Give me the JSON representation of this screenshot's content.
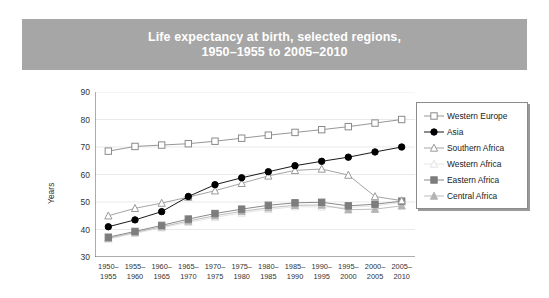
{
  "title": {
    "line1": "Life expectancy at birth, selected regions,",
    "line2": "1950–1955 to 2005–2010"
  },
  "axes": {
    "ylabel": "Years",
    "yticks": [
      "90",
      "80",
      "70",
      "60",
      "50",
      "40",
      "30"
    ]
  },
  "xticklabels_top": [
    "1950–",
    "1955–",
    "1960–",
    "1965–",
    "1970–",
    "1975–",
    "1980–",
    "1985–",
    "1990–",
    "1995–",
    "2000–",
    "2005–"
  ],
  "xticklabels_bottom": [
    "1955",
    "1960",
    "1965",
    "1970",
    "1975",
    "1980",
    "1985",
    "1990",
    "1995",
    "2000",
    "2005",
    "2010"
  ],
  "legend": {
    "items": [
      {
        "label": "Western Europe",
        "marker": "open-square",
        "color": "#8a8a8a"
      },
      {
        "label": "Asia",
        "marker": "filled-circle",
        "color": "#000000"
      },
      {
        "label": "Southern Africa",
        "marker": "open-triangle",
        "color": "#9a9a9a"
      },
      {
        "label": "Western Africa",
        "marker": "open-triangle",
        "color": "#e2e2e2"
      },
      {
        "label": "Eastern Africa",
        "marker": "filled-square",
        "color": "#7d7d7d"
      },
      {
        "label": "Central Africa",
        "marker": "filled-triangle",
        "color": "#b4b4b4"
      }
    ]
  },
  "chart_data": {
    "type": "line",
    "title": "Life expectancy at birth, selected regions, 1950–1955 to 2005–2010",
    "xlabel": "",
    "ylabel": "Years",
    "ylim": [
      30,
      90
    ],
    "ytick_step": 10,
    "grid": "horizontal",
    "legend_position": "right",
    "categories": [
      "1950–1955",
      "1955–1960",
      "1960–1965",
      "1965–1970",
      "1970–1975",
      "1975–1980",
      "1980–1985",
      "1985–1990",
      "1990–1995",
      "1995–2000",
      "2000–2005",
      "2005–2010"
    ],
    "series": [
      {
        "name": "Western Europe",
        "marker": "open-square",
        "color": "#8a8a8a",
        "values": [
          68.5,
          70.2,
          70.7,
          71.2,
          72.1,
          73.2,
          74.3,
          75.3,
          76.3,
          77.4,
          78.7,
          80.0
        ]
      },
      {
        "name": "Asia",
        "marker": "filled-circle",
        "color": "#000000",
        "values": [
          41.0,
          43.5,
          46.5,
          52.0,
          56.3,
          58.8,
          61.0,
          63.2,
          64.8,
          66.3,
          68.2,
          70.0
        ]
      },
      {
        "name": "Southern Africa",
        "marker": "open-triangle",
        "color": "#9a9a9a",
        "values": [
          45.0,
          47.7,
          49.6,
          51.8,
          54.1,
          56.8,
          59.5,
          61.5,
          62.0,
          59.8,
          52.0,
          50.5
        ]
      },
      {
        "name": "Western Africa",
        "marker": "open-triangle",
        "color": "#e2e2e2",
        "values": [
          36.5,
          38.6,
          40.6,
          42.6,
          44.4,
          46.0,
          47.3,
          48.3,
          48.2,
          48.0,
          48.6,
          49.8
        ]
      },
      {
        "name": "Eastern Africa",
        "marker": "filled-square",
        "color": "#7d7d7d",
        "values": [
          37.2,
          39.3,
          41.5,
          43.8,
          45.8,
          47.4,
          48.8,
          49.7,
          49.9,
          48.6,
          49.2,
          50.3
        ]
      },
      {
        "name": "Central Africa",
        "marker": "filled-triangle",
        "color": "#b4b4b4",
        "values": [
          36.8,
          38.9,
          41.0,
          43.1,
          45.0,
          46.6,
          47.9,
          48.8,
          48.9,
          47.2,
          47.4,
          48.6
        ]
      }
    ]
  }
}
